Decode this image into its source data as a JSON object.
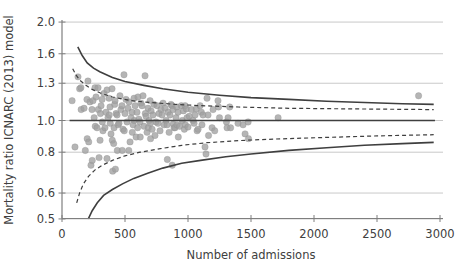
{
  "chart_data": {
    "type": "scatter",
    "subtype": "funnel-plot",
    "title": "",
    "xlabel": "Number of admissions",
    "ylabel": "Mortality ratio ICNARC (2013) model",
    "x_ticks": [
      0,
      500,
      1000,
      1500,
      2000,
      2500,
      3000
    ],
    "y_ticks": [
      2.0,
      1.6,
      1.3,
      1.0,
      0.8,
      0.6,
      0.5
    ],
    "xlim": [
      0,
      3000
    ],
    "ylim": [
      0.5,
      2.0
    ],
    "y_scale": "log",
    "grid": "horizontal",
    "legend": "none",
    "center_line": {
      "value": 1.0,
      "n_start": 60,
      "n_end": 2960,
      "style": "solid"
    },
    "control_limits": {
      "outer_style": "solid",
      "inner_style": "dashed",
      "outer_upper": [
        [
          125,
          1.68
        ],
        [
          160,
          1.58
        ],
        [
          200,
          1.5
        ],
        [
          250,
          1.445
        ],
        [
          300,
          1.41
        ],
        [
          400,
          1.355
        ],
        [
          500,
          1.315
        ],
        [
          650,
          1.28
        ],
        [
          800,
          1.25
        ],
        [
          1000,
          1.22
        ],
        [
          1250,
          1.195
        ],
        [
          1500,
          1.175
        ],
        [
          1800,
          1.16
        ],
        [
          2100,
          1.145
        ],
        [
          2400,
          1.135
        ],
        [
          2700,
          1.125
        ],
        [
          2950,
          1.12
        ]
      ],
      "outer_lower": [
        [
          209,
          0.5
        ],
        [
          240,
          0.53
        ],
        [
          280,
          0.56
        ],
        [
          330,
          0.59
        ],
        [
          400,
          0.615
        ],
        [
          480,
          0.64
        ],
        [
          570,
          0.665
        ],
        [
          680,
          0.69
        ],
        [
          800,
          0.715
        ],
        [
          950,
          0.74
        ],
        [
          1100,
          0.755
        ],
        [
          1300,
          0.775
        ],
        [
          1500,
          0.79
        ],
        [
          1800,
          0.81
        ],
        [
          2100,
          0.825
        ],
        [
          2400,
          0.84
        ],
        [
          2700,
          0.85
        ],
        [
          2950,
          0.857
        ]
      ],
      "inner_upper": [
        [
          85,
          1.44
        ],
        [
          110,
          1.38
        ],
        [
          140,
          1.33
        ],
        [
          180,
          1.29
        ],
        [
          230,
          1.25
        ],
        [
          300,
          1.215
        ],
        [
          400,
          1.18
        ],
        [
          550,
          1.15
        ],
        [
          700,
          1.135
        ],
        [
          900,
          1.12
        ],
        [
          1100,
          1.11
        ],
        [
          1400,
          1.1
        ],
        [
          1800,
          1.09
        ],
        [
          2300,
          1.085
        ],
        [
          2950,
          1.08
        ]
      ],
      "inner_lower": [
        [
          117,
          0.56
        ],
        [
          140,
          0.6
        ],
        [
          170,
          0.64
        ],
        [
          210,
          0.675
        ],
        [
          260,
          0.705
        ],
        [
          320,
          0.73
        ],
        [
          400,
          0.755
        ],
        [
          500,
          0.78
        ],
        [
          620,
          0.8
        ],
        [
          780,
          0.82
        ],
        [
          950,
          0.84
        ],
        [
          1150,
          0.855
        ],
        [
          1400,
          0.868
        ],
        [
          1700,
          0.878
        ],
        [
          2100,
          0.888
        ],
        [
          2500,
          0.897
        ],
        [
          2950,
          0.905
        ]
      ]
    },
    "points": [
      [
        80,
        1.15
      ],
      [
        103,
        0.83
      ],
      [
        127,
        1.36
      ],
      [
        140,
        1.25
      ],
      [
        150,
        1.26
      ],
      [
        152,
        1.08
      ],
      [
        175,
        1.09
      ],
      [
        185,
        0.81
      ],
      [
        198,
        1.16
      ],
      [
        200,
        0.88
      ],
      [
        206,
        1.32
      ],
      [
        212,
        0.86
      ],
      [
        222,
        1.14
      ],
      [
        230,
        0.73
      ],
      [
        238,
        1.08
      ],
      [
        240,
        0.755
      ],
      [
        246,
        1.15
      ],
      [
        255,
        1.02
      ],
      [
        262,
        1.26
      ],
      [
        264,
        0.96
      ],
      [
        270,
        1.18
      ],
      [
        278,
        0.95
      ],
      [
        286,
        1.26
      ],
      [
        288,
        1.08
      ],
      [
        294,
        0.77
      ],
      [
        302,
        0.87
      ],
      [
        305,
        1.05
      ],
      [
        310,
        1.11
      ],
      [
        318,
        1.16
      ],
      [
        320,
        0.99
      ],
      [
        325,
        0.93
      ],
      [
        333,
        1.21
      ],
      [
        341,
        0.95
      ],
      [
        349,
        1.06
      ],
      [
        357,
        1.24
      ],
      [
        357,
        0.765
      ],
      [
        365,
        1.02
      ],
      [
        373,
        1.17
      ],
      [
        375,
        1.04
      ],
      [
        381,
        1.1
      ],
      [
        383,
        0.98
      ],
      [
        389,
        0.91
      ],
      [
        397,
        1.25
      ],
      [
        399,
        0.87
      ],
      [
        402,
        0.7
      ],
      [
        410,
        0.85
      ],
      [
        413,
        0.95
      ],
      [
        418,
        1.12
      ],
      [
        421,
        1.15
      ],
      [
        424,
        0.71
      ],
      [
        429,
        1.05
      ],
      [
        437,
        1.04
      ],
      [
        439,
        0.81
      ],
      [
        445,
        0.97
      ],
      [
        452,
        0.98
      ],
      [
        460,
        1.19
      ],
      [
        468,
        1.08
      ],
      [
        476,
        1.11
      ],
      [
        478,
        0.81
      ],
      [
        484,
        0.94
      ],
      [
        492,
        1.38
      ],
      [
        494,
        0.93
      ],
      [
        500,
        1.05
      ],
      [
        508,
        1.16
      ],
      [
        516,
        0.99
      ],
      [
        524,
        1.09
      ],
      [
        530,
        0.81
      ],
      [
        532,
        1.14
      ],
      [
        540,
        0.86
      ],
      [
        548,
        1.02
      ],
      [
        556,
        1.06
      ],
      [
        558,
        0.92
      ],
      [
        564,
        0.97
      ],
      [
        572,
        1.17
      ],
      [
        574,
        1.0
      ],
      [
        580,
        1.11
      ],
      [
        588,
        0.89
      ],
      [
        595,
        1.06
      ],
      [
        600,
        0.95
      ],
      [
        603,
        1.18
      ],
      [
        610,
        1.01
      ],
      [
        619,
        0.99
      ],
      [
        621,
        0.89
      ],
      [
        627,
        1.13
      ],
      [
        635,
        1.11
      ],
      [
        643,
        1.19
      ],
      [
        651,
        0.96
      ],
      [
        659,
        1.37
      ],
      [
        661,
        1.05
      ],
      [
        667,
        1.03
      ],
      [
        675,
        0.92
      ],
      [
        683,
        1.09
      ],
      [
        685,
        0.95
      ],
      [
        691,
        1.0
      ],
      [
        699,
        1.15
      ],
      [
        701,
        0.98
      ],
      [
        703,
        0.88
      ],
      [
        707,
        1.07
      ],
      [
        715,
        0.94
      ],
      [
        722,
        1.04
      ],
      [
        730,
        1.12
      ],
      [
        738,
        0.9
      ],
      [
        746,
        0.99
      ],
      [
        754,
        1.11
      ],
      [
        762,
        0.98
      ],
      [
        770,
        1.05
      ],
      [
        778,
        0.93
      ],
      [
        786,
        1.08
      ],
      [
        794,
        1.04
      ],
      [
        802,
        1.13
      ],
      [
        810,
        0.97
      ],
      [
        818,
        1.09
      ],
      [
        826,
        1.0
      ],
      [
        834,
        0.97
      ],
      [
        836,
        0.76
      ],
      [
        842,
        1.06
      ],
      [
        850,
        0.92
      ],
      [
        857,
        1.04
      ],
      [
        865,
        1.12
      ],
      [
        873,
        1.11
      ],
      [
        875,
        0.73
      ],
      [
        881,
        1.08
      ],
      [
        883,
        0.975
      ],
      [
        889,
        0.95
      ],
      [
        897,
        0.95
      ],
      [
        905,
        1.02
      ],
      [
        911,
        1.1
      ],
      [
        913,
        0.97
      ],
      [
        921,
        1.06
      ],
      [
        923,
        0.89
      ],
      [
        934,
        0.96
      ],
      [
        947,
        1.11
      ],
      [
        955,
        1.0
      ],
      [
        963,
        1.07
      ],
      [
        971,
        0.94
      ],
      [
        977,
        1.11
      ],
      [
        979,
        0.97
      ],
      [
        987,
        1.085
      ],
      [
        992,
        1.02
      ],
      [
        1000,
        0.955
      ],
      [
        1010,
        1.03
      ],
      [
        1027,
        1.08
      ],
      [
        1040,
        1.0
      ],
      [
        1048,
        0.98
      ],
      [
        1056,
        1.04
      ],
      [
        1066,
        1.085
      ],
      [
        1072,
        0.93
      ],
      [
        1080,
        0.94
      ],
      [
        1096,
        1.11
      ],
      [
        1106,
        1.06
      ],
      [
        1111,
        0.97
      ],
      [
        1119,
        1.04
      ],
      [
        1135,
        0.83
      ],
      [
        1143,
        0.79
      ],
      [
        1151,
        1.17
      ],
      [
        1159,
        1.04
      ],
      [
        1163,
        0.9
      ],
      [
        1191,
        0.95
      ],
      [
        1199,
        1.08
      ],
      [
        1212,
        0.93
      ],
      [
        1238,
        1.15
      ],
      [
        1242,
        1.1
      ],
      [
        1250,
        1.02
      ],
      [
        1305,
        0.99
      ],
      [
        1310,
        0.95
      ],
      [
        1318,
        1.02
      ],
      [
        1331,
        1.1
      ],
      [
        1338,
        0.95
      ],
      [
        1397,
        0.98
      ],
      [
        1437,
        0.97
      ],
      [
        1453,
        0.91
      ],
      [
        1477,
        0.99
      ],
      [
        1480,
        0.88
      ],
      [
        1715,
        1.02
      ],
      [
        2830,
        1.19
      ]
    ],
    "colors": {
      "point": "#a0a0a0",
      "limit_line": "#3f3f3f",
      "center_line": "#3f3f3f",
      "grid_line": "#c9c9c9",
      "axis_line": "#7f7f7f",
      "text": "#404040",
      "background": "#ffffff"
    }
  }
}
